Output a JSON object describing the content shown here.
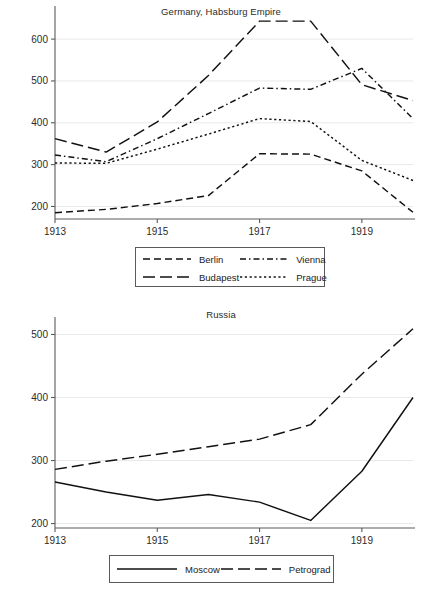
{
  "chart_data": [
    {
      "type": "line",
      "title": "Germany, Habsburg Empire",
      "xlabel": "",
      "ylabel": "",
      "x": [
        1913,
        1914,
        1915,
        1916,
        1917,
        1918,
        1919,
        1920
      ],
      "xtick_labels": [
        "1913",
        "1915",
        "1917",
        "1919"
      ],
      "xticks": [
        1913,
        1915,
        1917,
        1919
      ],
      "ytick_labels": [
        "200",
        "300",
        "400",
        "500",
        "600"
      ],
      "yticks": [
        200,
        300,
        400,
        500,
        600
      ],
      "xlim": [
        1913,
        1920
      ],
      "ylim": [
        170,
        660
      ],
      "grid": true,
      "legend_position": "below",
      "series": [
        {
          "name": "Berlin",
          "dash": "7,4",
          "values": [
            185,
            193,
            207,
            226,
            326,
            325,
            285,
            186
          ]
        },
        {
          "name": "Budapest",
          "dash": "12,5",
          "values": [
            362,
            330,
            402,
            513,
            643,
            643,
            491,
            453
          ]
        },
        {
          "name": "Vienna",
          "dash": "6,3,1.5,3",
          "values": [
            323,
            307,
            362,
            422,
            483,
            480,
            530,
            410
          ]
        },
        {
          "name": "Prague",
          "dash": "2.2,2.6",
          "values": [
            304,
            303,
            337,
            373,
            410,
            403,
            310,
            262
          ]
        }
      ]
    },
    {
      "type": "line",
      "title": "Russia",
      "xlabel": "",
      "ylabel": "",
      "x": [
        1913,
        1914,
        1915,
        1916,
        1917,
        1918,
        1919,
        1920
      ],
      "xtick_labels": [
        "1913",
        "1915",
        "1917",
        "1919"
      ],
      "xticks": [
        1913,
        1915,
        1917,
        1919
      ],
      "ytick_labels": [
        "200",
        "300",
        "400",
        "500"
      ],
      "yticks": [
        200,
        300,
        400,
        500
      ],
      "xlim": [
        1913,
        1920
      ],
      "ylim": [
        193,
        515
      ],
      "grid": true,
      "legend_position": "below",
      "series": [
        {
          "name": "Moscow",
          "dash": "none",
          "values": [
            266,
            250,
            237,
            246,
            234,
            205,
            283,
            400
          ]
        },
        {
          "name": "Petrograd",
          "dash": "12,5",
          "values": [
            286,
            299,
            310,
            322,
            334,
            357,
            437,
            509
          ]
        }
      ]
    }
  ],
  "top_chart": {
    "title": "Germany, Habsburg Empire",
    "legend": [
      {
        "label": "Berlin"
      },
      {
        "label": "Vienna"
      },
      {
        "label": "Budapest"
      },
      {
        "label": "Prague"
      }
    ]
  },
  "bottom_chart": {
    "title": "Russia",
    "legend": [
      {
        "label": "Moscow"
      },
      {
        "label": "Petrograd"
      }
    ]
  },
  "colors": {
    "line": "#111111",
    "axis": "#5a5a5a",
    "grid": "#e9e9e9",
    "text": "#2b2b2b",
    "background": "#ffffff"
  }
}
